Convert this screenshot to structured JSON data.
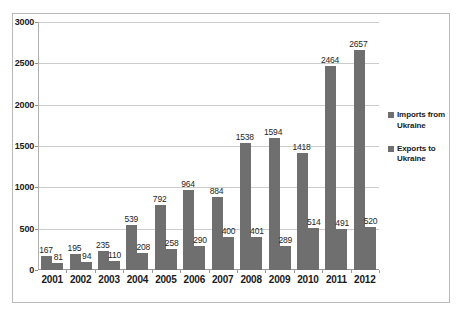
{
  "chart_data": {
    "type": "bar",
    "title": "",
    "subtitle": "",
    "xlabel": "",
    "ylabel": "",
    "ylim": [
      0,
      3000
    ],
    "yticks": [
      0,
      500,
      1000,
      1500,
      2000,
      2500,
      3000
    ],
    "ytick_labels": [
      "0",
      "500",
      "1000",
      "1500",
      "2000",
      "2500",
      "3000"
    ],
    "grid": true,
    "legend_position": "right",
    "categories": [
      "2001",
      "2002",
      "2003",
      "2004",
      "2005",
      "2006",
      "2007",
      "2008",
      "2009",
      "2010",
      "2011",
      "2012"
    ],
    "series": [
      {
        "name": "Imports from Ukraine",
        "color": "#6f6f6f",
        "values": [
          167,
          195,
          235,
          539,
          792,
          964,
          884,
          1538,
          1594,
          1418,
          2464,
          2657
        ]
      },
      {
        "name": "Exports to Ukraine",
        "color": "#6f6f6f",
        "values": [
          81,
          94,
          110,
          208,
          258,
          290,
          400,
          401,
          289,
          514,
          491,
          520
        ]
      }
    ]
  },
  "legend": {
    "items": [
      {
        "label_line1": "Imports from",
        "label_line2": "Ukraine"
      },
      {
        "label_line1": "Exports to",
        "label_line2": "Ukraine"
      }
    ]
  }
}
